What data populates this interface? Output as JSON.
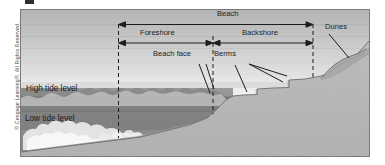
{
  "figure": {
    "type": "beach-profile-cross-section-diagram",
    "copyright": "© Cengage Learning®. All Rights Reserved."
  },
  "labels": {
    "beach": "Beach",
    "foreshore": "Foreshore",
    "backshore": "Backshore",
    "beach_face": "Beach face",
    "berms": "Berms",
    "dunes": "Dunes",
    "high_tide": "High tide level",
    "low_tide": "Low tide level"
  },
  "colors": {
    "sky_top": "#b7b7b7",
    "sky_bottom": "#f2f2f2",
    "water": "#8e8e8e",
    "water_deep": "#7d7d7d",
    "sand_dry": "#b3b3b3",
    "sand_wet": "#9a9a9a",
    "sand_sub": "#a6a6a6",
    "dune": "#a8a8a8",
    "line": "#1d1d1d",
    "frame": "#7a7a7a",
    "foam": "#e8e8e8"
  },
  "annotations": {
    "beach_span": {
      "from": "Foreshore start",
      "to": "Backshore end"
    },
    "foreshore_span": {
      "from": "low tide datum line",
      "to": "beach face crest"
    },
    "backshore_span": {
      "from": "beach face crest",
      "to": "dune toe"
    }
  }
}
